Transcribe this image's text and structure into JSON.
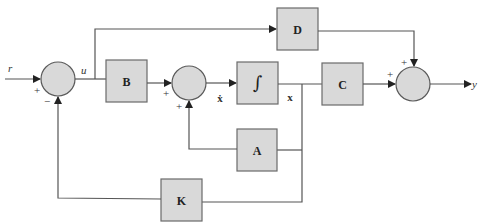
{
  "diagram": {
    "type": "state-space block diagram with state feedback",
    "blocks": {
      "B": "B",
      "integrator": "∫",
      "C": "C",
      "D": "D",
      "A": "A",
      "K": "K"
    },
    "signals": {
      "input": "r",
      "control": "u",
      "state_derivative": "ẋ",
      "state": "x",
      "output": "y"
    },
    "summing_junctions": {
      "sum1": {
        "signs": [
          "+",
          "−"
        ]
      },
      "sum2": {
        "signs": [
          "+",
          "+"
        ]
      },
      "sum3": {
        "signs": [
          "+",
          "+"
        ]
      }
    },
    "colors": {
      "block_fill": "#d9d9d9",
      "line": "#555555",
      "background": "#ffffff"
    }
  }
}
